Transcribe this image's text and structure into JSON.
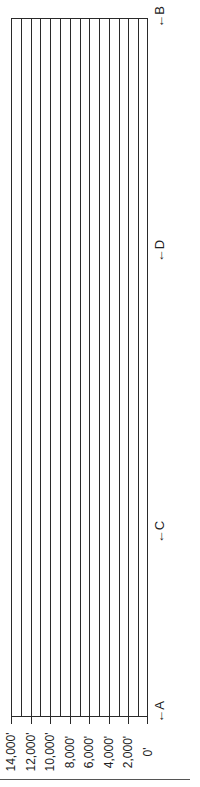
{
  "diagram": {
    "type": "elevation-profile-grid",
    "orientation": "rotated-90-ccw",
    "grid_color": "#2a2a2a",
    "elevation_labels": [
      "14,000'",
      "12,000'",
      "10,000'",
      "8,000'",
      "6,000'",
      "4,000'",
      "2,000'",
      "0'"
    ],
    "grid_line_count": 15,
    "markers": [
      {
        "label": "A",
        "arrow": "←"
      },
      {
        "label": "C",
        "arrow": "←"
      },
      {
        "label": "D",
        "arrow": "←"
      },
      {
        "label": "B",
        "arrow": "←"
      }
    ]
  }
}
